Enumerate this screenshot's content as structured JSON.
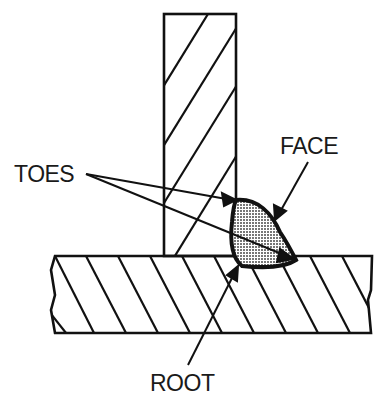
{
  "diagram": {
    "type": "weld-cross-section",
    "labels": {
      "toes": "TOES",
      "face": "FACE",
      "root": "ROOT"
    },
    "colors": {
      "line": "#111111",
      "background": "#ffffff",
      "weld_fill": "#d8d8d8"
    }
  }
}
